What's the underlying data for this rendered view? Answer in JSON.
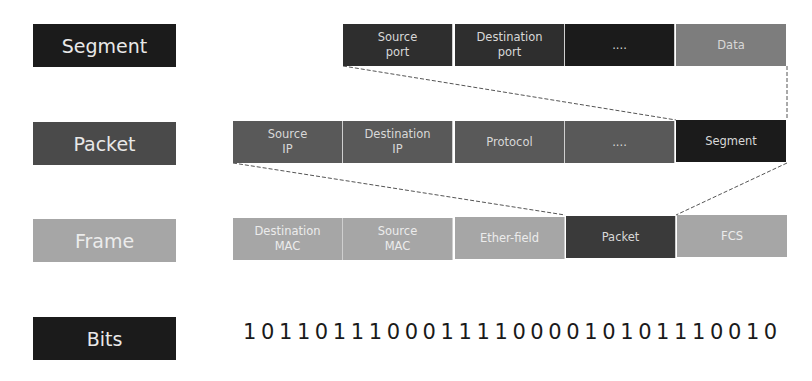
{
  "rows": {
    "segment": {
      "label": "Segment",
      "fields": [
        "Source\nport",
        "Destination\nport",
        "....",
        "Data"
      ]
    },
    "packet": {
      "label": "Packet",
      "fields": [
        "Source\nIP",
        "Destination\nIP",
        "Protocol",
        "....",
        "Segment"
      ]
    },
    "frame": {
      "label": "Frame",
      "fields": [
        "Destination\nMAC",
        "Source\nMAC",
        "Ether-field",
        "Packet",
        "FCS"
      ]
    },
    "bits": {
      "label": "Bits",
      "value": "101101110001111000010101110010"
    }
  }
}
